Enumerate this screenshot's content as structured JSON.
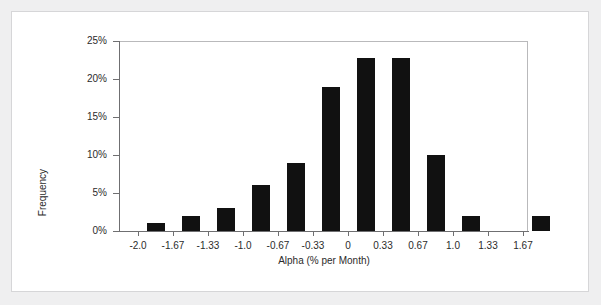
{
  "figure": {
    "background_color": "#efeff0",
    "panel_color": "#ffffff",
    "bar_color": "#111111",
    "axis_color": "#6f6f71"
  },
  "chart_data": {
    "type": "bar",
    "title": "",
    "xlabel": "Alpha (% per Month)",
    "ylabel": "Frequency",
    "grid": false,
    "legend": null,
    "ylim": [
      0,
      25
    ],
    "ytick_labels": [
      "0%",
      "5%",
      "10%",
      "15%",
      "20%",
      "25%"
    ],
    "ytick_values": [
      0,
      5,
      10,
      15,
      20,
      25
    ],
    "xtick_labels": [
      "-2.0",
      "-1.67",
      "-1.33",
      "-1.0",
      "-0.67",
      "-0.33",
      "0",
      "0.33",
      "0.67",
      "1.0",
      "1.33",
      "1.67"
    ],
    "xtick_values": [
      -2.0,
      -1.67,
      -1.33,
      -1.0,
      -0.67,
      -0.33,
      0,
      0.33,
      0.67,
      1.0,
      1.33,
      1.67
    ],
    "xlim": [
      -2.18,
      1.85
    ],
    "bin_width": 0.33,
    "categories": [
      "-2.17 to -1.84",
      "-1.84 to -1.50",
      "-1.50 to -1.17",
      "-1.17 to -0.84",
      "-0.84 to -0.50",
      "-0.50 to -0.17",
      "-0.17 to 0.17",
      "0.17 to 0.50",
      "0.50 to 0.84",
      "0.84 to 1.17",
      "1.17 to 1.50",
      "1.50 to 1.84"
    ],
    "bin_centers": [
      -2.0,
      -1.67,
      -1.33,
      -1.0,
      -0.67,
      -0.33,
      0,
      0.33,
      0.67,
      1.0,
      1.33,
      1.67
    ],
    "values": [
      1.0,
      2.0,
      3.0,
      6.0,
      9.0,
      19.0,
      22.8,
      22.8,
      10.0,
      2.0,
      0.0,
      2.0
    ]
  }
}
